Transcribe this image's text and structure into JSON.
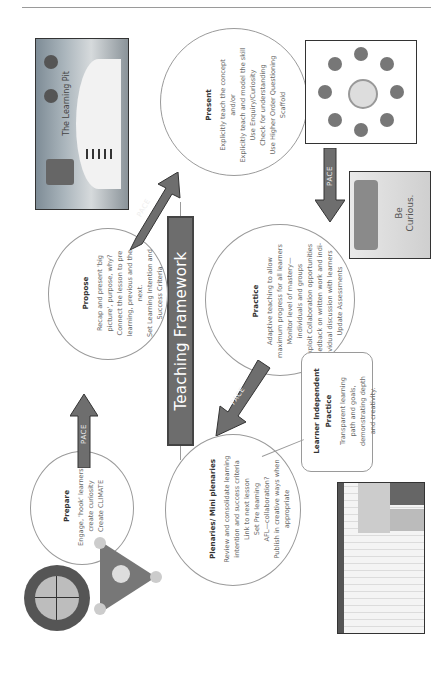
{
  "document": {
    "title": "Teaching Framework",
    "school": {
      "name_top": "BEAUMONT",
      "name_bottom": "SCHOOL"
    },
    "arrow_label": "PACE",
    "stages": {
      "prepare": {
        "heading": "Prepare",
        "lines": [
          "Engage, 'hook' learners,",
          "create curiosity",
          "Create CLIMATE"
        ]
      },
      "propose": {
        "heading": "Propose",
        "lines": [
          "Recap and present 'big",
          "picture', purpose, why?",
          "Connect the lesson to pre",
          "learning, previous and the",
          "next.",
          "Set Learning Intention and",
          "Success Criteria"
        ]
      },
      "present": {
        "heading": "Present",
        "lines": [
          "Explicitly teach the concept",
          "and/or",
          "Explicitly teach and model the skill",
          "Use Enquiry/Curiosity",
          "Check for understanding",
          "Use Higher Order Questioning",
          "Scaffold"
        ]
      },
      "practice": {
        "heading": "Practice",
        "lines": [
          "Adaptive teaching to allow",
          "maximum progress for all learners",
          "Monitor level of mastery—",
          "individuals and groups",
          "Exploit Collaboration opportunities",
          "Feedback on written work and indi-",
          "vidual discussion with learners",
          "Update Assessments"
        ]
      },
      "plenaries": {
        "heading": "Plenaries/ Mini plenaries",
        "lines": [
          "Review and consolidate learning",
          "intention and success criteria",
          "Link to next lesson",
          "Set Pre learning",
          "AFL—collaboration?",
          "Publish in creative ways when",
          "appropriate"
        ]
      },
      "learner_independent": {
        "heading_lines": [
          "Learner Independent",
          "Practice"
        ],
        "lines": [
          "Transparent learning",
          "path and goals,",
          "demonstrating depth",
          "and creativity."
        ]
      }
    },
    "images": {
      "learning_pit": {
        "title": "The Learning Pit",
        "caption": "Failure is not the opposite of success, it's part of it."
      },
      "curious_poster": {
        "lines": [
          "Be",
          "Curious.",
          "Stay",
          "Curious."
        ]
      }
    }
  }
}
